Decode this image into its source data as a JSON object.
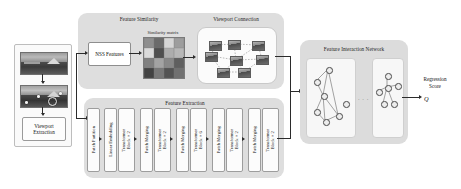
{
  "figure": {
    "type": "architecture-diagram",
    "title_visible": false
  },
  "panels": {
    "feature_similarity": {
      "title": "Feature Similarity"
    },
    "viewport_connection": {
      "title": "Viewport Connection"
    },
    "feature_extraction": {
      "title": "Feature Extraction"
    },
    "feature_interaction_network": {
      "title": "Feature Interaction Network"
    }
  },
  "input": {
    "viewport_extraction_label": "Viewport Extraction",
    "images": [
      {
        "name": "panorama-source",
        "alt": "equirectangular panorama"
      },
      {
        "name": "panorama-with-viewports",
        "alt": "panorama with viewport markers"
      }
    ]
  },
  "nss": {
    "box_label": "NSS Features",
    "matrix_label": "Similarity matrix",
    "matrix": {
      "rows": 4,
      "cols": 4,
      "values": [
        [
          0.55,
          0.72,
          0.2,
          0.48
        ],
        [
          0.18,
          0.86,
          0.4,
          0.35
        ],
        [
          0.62,
          0.45,
          0.58,
          0.78
        ],
        [
          0.92,
          0.66,
          0.84,
          0.7
        ]
      ]
    }
  },
  "feature_extraction": {
    "blocks": [
      {
        "label": "Patch Partition"
      },
      {
        "label": "Linear Embedding"
      },
      {
        "label": "Transformer\nBlock × 2"
      },
      {
        "label": "Patch Merging"
      },
      {
        "label": "Transformer\nBlock × 2"
      },
      {
        "label": "Patch Merging"
      },
      {
        "label": "Transformer\nBlock × 6"
      },
      {
        "label": "Patch Merging"
      },
      {
        "label": "Transformer\nBlock × 2"
      }
    ]
  },
  "viewport_connection": {
    "node_count": 8,
    "edge_style": "dashed"
  },
  "feature_interaction_network": {
    "ellipsis": "· · ·",
    "graphs": [
      {
        "name": "graph-left",
        "nodes": 7
      },
      {
        "name": "graph-mid",
        "nodes": 3
      },
      {
        "name": "graph-right",
        "nodes": 5
      }
    ]
  },
  "output": {
    "label_line1": "Regression",
    "label_line2": "Score",
    "symbol": "Q"
  },
  "colors": {
    "group_panel": "#dedede",
    "card": "#fbfbfb",
    "stroke": "#2b2b2b",
    "text": "#131313"
  }
}
